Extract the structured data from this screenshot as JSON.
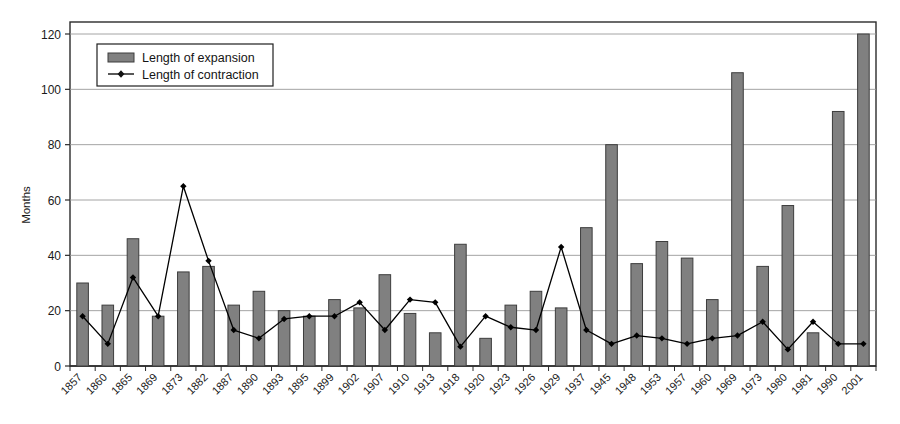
{
  "chart_data": {
    "type": "bar",
    "title": "",
    "xlabel": "",
    "ylabel": "Months",
    "ylim": [
      0,
      120
    ],
    "ytick_step": 20,
    "yticks": [
      0,
      20,
      40,
      60,
      80,
      100,
      120
    ],
    "grid": true,
    "legend_position": "upper-left",
    "categories": [
      "1857",
      "1860",
      "1865",
      "1869",
      "1873",
      "1882",
      "1887",
      "1890",
      "1893",
      "1895",
      "1899",
      "1902",
      "1907",
      "1910",
      "1913",
      "1918",
      "1920",
      "1923",
      "1926",
      "1929",
      "1937",
      "1945",
      "1948",
      "1953",
      "1957",
      "1960",
      "1969",
      "1973",
      "1980",
      "1981",
      "1990",
      "2001"
    ],
    "series": [
      {
        "name": "Length of expansion",
        "render": "bar",
        "color": "#808080",
        "values": [
          30,
          22,
          46,
          18,
          34,
          36,
          22,
          27,
          20,
          18,
          24,
          21,
          33,
          19,
          12,
          44,
          10,
          22,
          27,
          21,
          50,
          80,
          37,
          45,
          39,
          24,
          106,
          36,
          58,
          12,
          92,
          120
        ]
      },
      {
        "name": "Length of contraction",
        "render": "line",
        "color": "#000000",
        "marker": "diamond",
        "values": [
          18,
          8,
          32,
          18,
          65,
          38,
          13,
          10,
          17,
          18,
          18,
          23,
          13,
          24,
          23,
          7,
          18,
          14,
          13,
          43,
          13,
          8,
          11,
          10,
          8,
          10,
          11,
          16,
          6,
          16,
          8,
          8
        ]
      }
    ]
  },
  "axis": {
    "y_title": "Months",
    "y_tick_labels": [
      "0",
      "20",
      "40",
      "60",
      "80",
      "100",
      "120"
    ]
  },
  "legend": {
    "items": [
      {
        "label": "Length of expansion",
        "swatch": "bar-swatch"
      },
      {
        "label": "Length of contraction",
        "swatch": "line-marker-swatch"
      }
    ]
  },
  "colors": {
    "bar_fill": "#808080",
    "bar_stroke": "#3d3d3d",
    "line_stroke": "#111111",
    "grid": "#9a9a9a",
    "axis": "#2b2b2b",
    "background": "#ffffff"
  }
}
